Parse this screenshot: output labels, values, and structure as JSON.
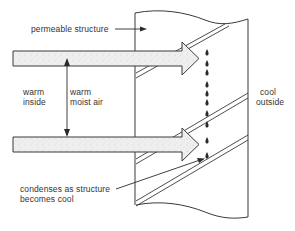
{
  "diagram": {
    "labels": {
      "permeable_structure": "permeable structure",
      "warm_inside_1": "warm",
      "warm_inside_2": "inside",
      "warm_moist_air_1": "warm",
      "warm_moist_air_2": "moist air",
      "cool_outside_1": "cool",
      "cool_outside_2": "outside",
      "condenses_1": "condenses as structure",
      "condenses_2": "becomes cool"
    },
    "elements": {
      "structure": "permeable-wall-section",
      "airflow_arrows": 2,
      "condensation_droplets": 10,
      "layer_lines": 3
    },
    "colors": {
      "line": "#3a3a3a",
      "arrow_fill": "#ececec",
      "background": "#ffffff"
    }
  }
}
